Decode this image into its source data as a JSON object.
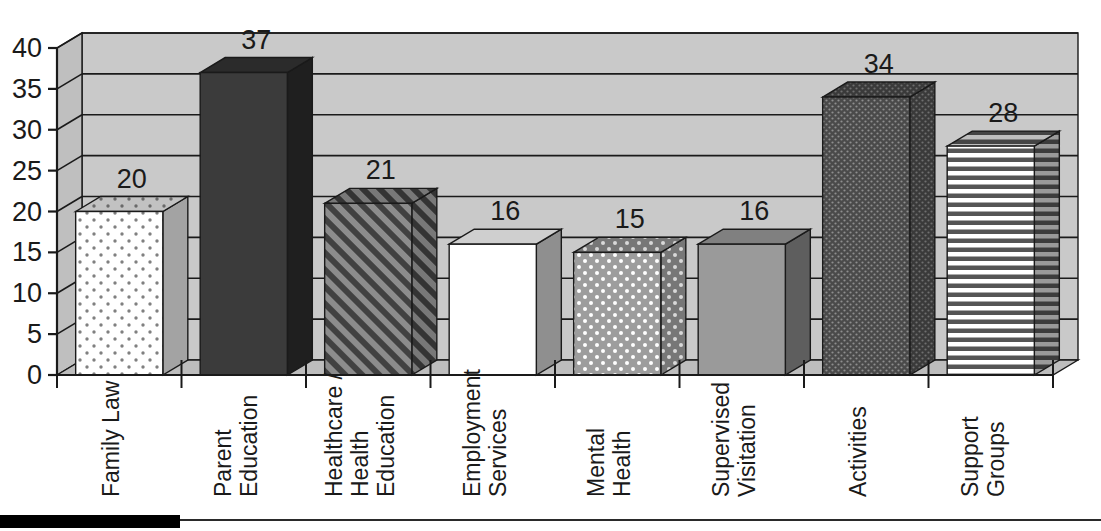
{
  "chart_data": {
    "type": "bar",
    "title": "",
    "subtitle": "",
    "xlabel": "",
    "ylabel": "",
    "categories": [
      "Family Law",
      "Healthcare /|Health|Education",
      "Parent|Education",
      "Employment|Services",
      "Mental|Health",
      "Supervised|Visitation",
      "Activities",
      "Support|Groups"
    ],
    "category_lines": [
      [
        "Family Law"
      ],
      [
        "Parent",
        "Education"
      ],
      [
        "Healthcare /",
        "Health",
        "Education"
      ],
      [
        "Employment",
        "Services"
      ],
      [
        "Mental",
        "Health"
      ],
      [
        "Supervised",
        "Visitation"
      ],
      [
        "Activities"
      ],
      [
        "Support",
        "Groups"
      ]
    ],
    "values": [
      20,
      37,
      21,
      16,
      15,
      16,
      34,
      28
    ],
    "data_labels": [
      "20",
      "37",
      "21",
      "16",
      "15",
      "16",
      "34",
      "28"
    ],
    "ylim": [
      0,
      40
    ],
    "yticks": [
      0,
      5,
      10,
      15,
      20,
      25,
      30,
      35,
      40
    ],
    "ytick_labels": [
      "0",
      "5",
      "10",
      "15",
      "20",
      "25",
      "30",
      "35",
      "40"
    ],
    "grid": true,
    "grid_axis": "y",
    "legend": "none",
    "three_d": true,
    "bar_fills": [
      "white-dots",
      "dark-solid",
      "diagonal-hatch",
      "white-solid",
      "gray-white-dots",
      "gray-solid",
      "dark-dots",
      "horizontal-stripes"
    ]
  },
  "style": {
    "plot_background": "#c9c9c9",
    "wall_top": "#cfcfcf",
    "floor": "#bdbdbd",
    "axis_color": "#1a1a1a",
    "grid_color": "#1a1a1a",
    "text_color": "#1a1a1a",
    "bar_dark": "#3b3b3b",
    "bar_gray": "#9a9a9a",
    "bar_white": "#ffffff",
    "side_shade": "#6e6e6e",
    "footer_swatch": "#000000"
  },
  "footer": {
    "swatch_label": "",
    "rule_label": ""
  }
}
